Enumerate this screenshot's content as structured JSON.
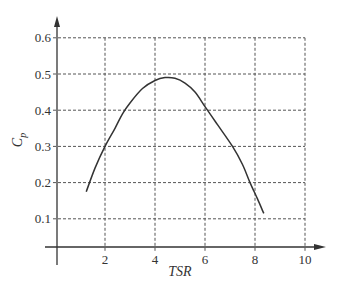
{
  "chart_data": {
    "type": "line",
    "title": "",
    "xlabel": "TSR",
    "ylabel": "C_p",
    "ylabel_main": "C",
    "ylabel_sub": "p",
    "xlim": [
      0,
      10
    ],
    "ylim": [
      0,
      0.6
    ],
    "x_ticks": [
      2,
      4,
      6,
      8,
      10
    ],
    "x_tick_labels": [
      "2",
      "4",
      "6",
      "8",
      "10"
    ],
    "y_ticks": [
      0.1,
      0.2,
      0.3,
      0.4,
      0.5,
      0.6
    ],
    "y_tick_labels": [
      "0.1",
      "0.2",
      "0.3",
      "0.4",
      "0.5",
      "0.6"
    ],
    "grid": true,
    "grid_style": "dashed",
    "legend": null,
    "series": [
      {
        "name": "Cp vs TSR",
        "x": [
          1.25,
          1.6,
          2.0,
          2.4,
          2.7,
          3.0,
          3.5,
          4.0,
          4.4,
          4.8,
          5.2,
          5.6,
          6.0,
          6.5,
          7.1,
          7.5,
          7.8,
          8.1,
          8.35
        ],
        "y": [
          0.175,
          0.24,
          0.3,
          0.35,
          0.39,
          0.42,
          0.46,
          0.482,
          0.49,
          0.488,
          0.475,
          0.45,
          0.41,
          0.36,
          0.3,
          0.25,
          0.2,
          0.155,
          0.115
        ]
      }
    ]
  }
}
